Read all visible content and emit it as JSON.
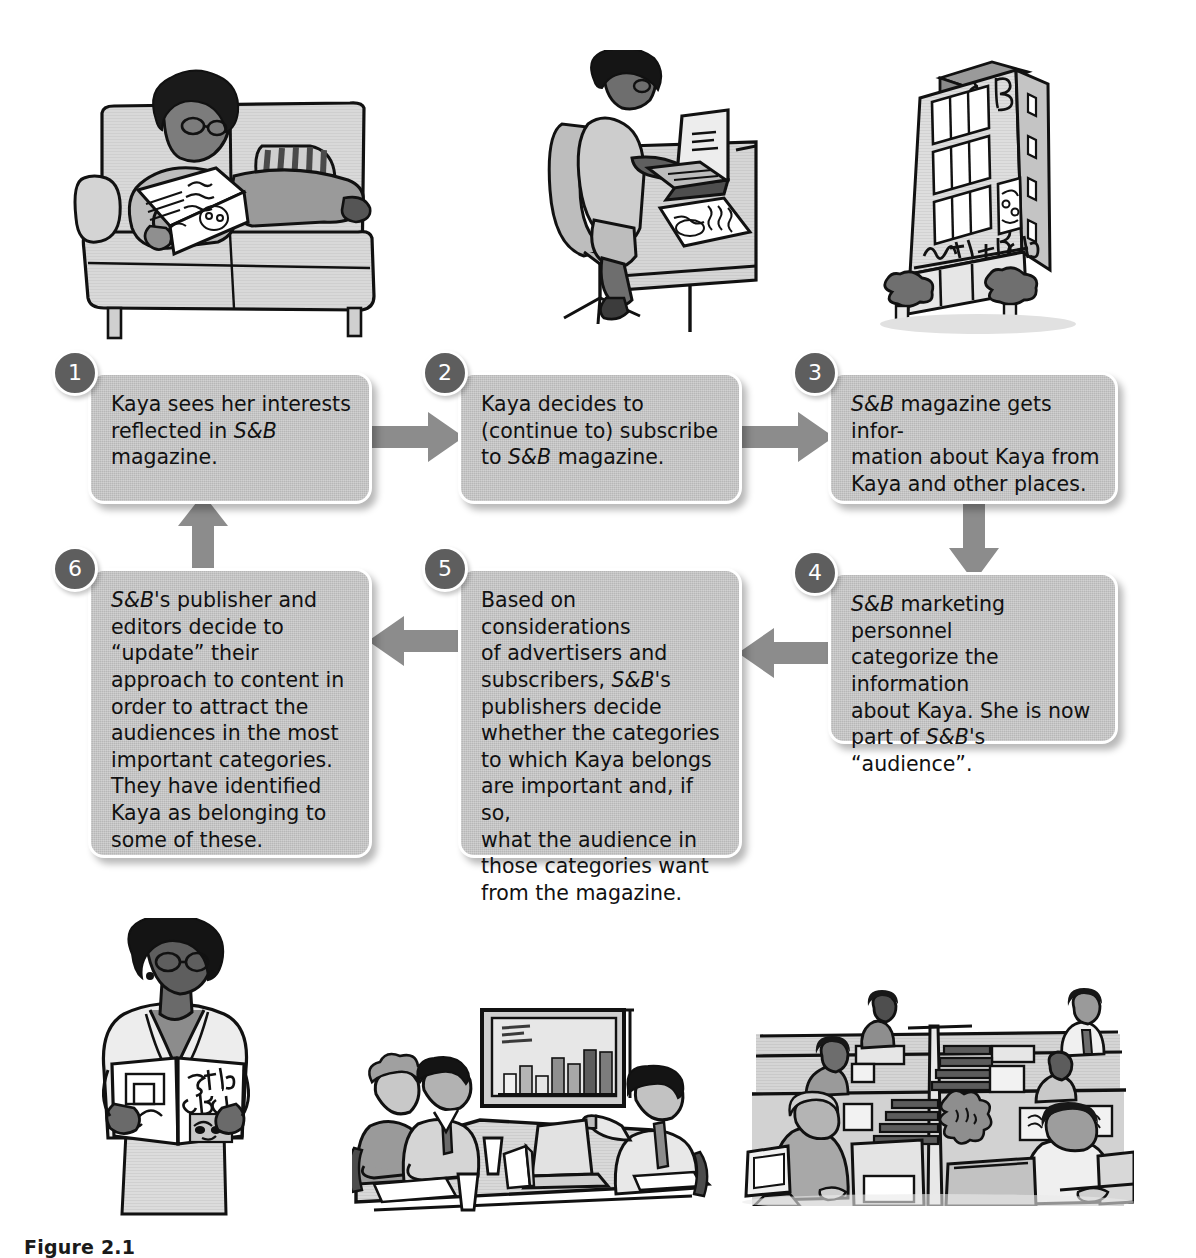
{
  "figure": {
    "caption_label": "Figure 2.1",
    "brand": "Style + Beauty",
    "brand_short": "S&B",
    "accent_box": "#b7b7b7",
    "accent_badge": "#5e5e5e",
    "accent_arrow": "#8c8c8c",
    "text_color": "#111111"
  },
  "steps": [
    {
      "number": "1",
      "text_parts": [
        "Kaya sees her interests\nreflected in ",
        "S&B",
        "\nmagazine."
      ],
      "plain": "Kaya sees her interests reflected in S&B magazine."
    },
    {
      "number": "2",
      "text_parts": [
        "Kaya decides to\n(continue to) subscribe\nto ",
        "S&B",
        " magazine."
      ],
      "plain": "Kaya decides to (continue to) subscribe to S&B magazine."
    },
    {
      "number": "3",
      "text_parts": [
        "",
        "S&B",
        " magazine gets infor-\nmation about Kaya from\nKaya and other places."
      ],
      "plain": "S&B magazine gets information about Kaya from Kaya and other places."
    },
    {
      "number": "4",
      "text_parts": [
        "",
        "S&B",
        " marketing personnel\ncategorize the information\nabout Kaya. She is now\npart of ",
        "S&B",
        "'s “audience”."
      ],
      "plain": "S&B marketing personnel categorize the information about Kaya. She is now part of S&B's “audience”."
    },
    {
      "number": "5",
      "text_parts": [
        "Based on considerations\nof advertisers and\nsubscribers, ",
        "S&B",
        "'s\npublishers decide\nwhether the categories\nto which Kaya belongs\nare important and, if so,\nwhat the audience in\nthose categories want\nfrom the magazine."
      ],
      "plain": "Based on considerations of advertisers and subscribers, S&B's publishers decide whether the categories to which Kaya belongs are important and, if so, what the audience in those categories want from the magazine."
    },
    {
      "number": "6",
      "text_parts": [
        "",
        "S&B",
        "'s publisher and\neditors decide to\n“update” their\napproach to content in\norder to attract the\naudiences in the most\nimportant categories.\nThey have identified\nKaya as belonging to\nsome of these."
      ],
      "plain": "S&B's publisher and editors decide to “update” their approach to content in order to attract the audiences in the most important categories. They have identified Kaya as belonging to some of these."
    }
  ],
  "arrows": [
    {
      "name": "arrow-1-to-2",
      "direction": "right",
      "from": "1",
      "to": "2"
    },
    {
      "name": "arrow-2-to-3",
      "direction": "right",
      "from": "2",
      "to": "3"
    },
    {
      "name": "arrow-3-to-4",
      "direction": "down",
      "from": "3",
      "to": "4"
    },
    {
      "name": "arrow-4-to-5",
      "direction": "left",
      "from": "4",
      "to": "5"
    },
    {
      "name": "arrow-5-to-6",
      "direction": "left",
      "from": "5",
      "to": "6"
    },
    {
      "name": "arrow-6-to-1",
      "direction": "up",
      "from": "6",
      "to": "1"
    }
  ],
  "illustrations": [
    {
      "name": "woman-reading-on-couch",
      "description": "Woman with afro and glasses reclining on a couch reading Style + Beauty magazine",
      "magazine_title": "Style + Beauty"
    },
    {
      "name": "woman-at-laptop-desk",
      "description": "Woman at a desk typing on a laptop with Style + Beauty magazine beside her",
      "magazine_title": "Style + Beauty"
    },
    {
      "name": "magazine-office-building",
      "description": "Multi-story publishing building with S&B monogram and Style+Beauty sign",
      "sign_text": "Style+Beauty",
      "monogram": "S+B"
    },
    {
      "name": "woman-standing-reading",
      "description": "Woman standing and reading an open Style + Beauty magazine",
      "magazine_title": "Style + Beauty"
    },
    {
      "name": "marketing-meeting",
      "description": "Three people in a conference room reviewing a bar chart on a presentation screen"
    },
    {
      "name": "office-cubicles",
      "description": "Open-plan office with workers in cubicles at computers"
    }
  ]
}
